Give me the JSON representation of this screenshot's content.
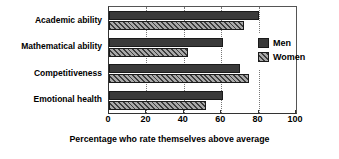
{
  "chart_data": {
    "type": "bar",
    "orientation": "horizontal",
    "title": "",
    "categories": [
      "Academic ability",
      "Mathematical ability",
      "Competitiveness",
      "Emotional health"
    ],
    "series": [
      {
        "name": "Men",
        "values": [
          80,
          61,
          70,
          61
        ],
        "color": "#3a3a3a",
        "fill": "solid"
      },
      {
        "name": "Women",
        "values": [
          72,
          42,
          75,
          52
        ],
        "color": "#a8a8a8",
        "fill": "diagonal-hatch"
      }
    ],
    "xlabel": "Percentage who rate themselves above average",
    "ylabel": "",
    "xlim": [
      0,
      100
    ],
    "xticks": [
      0,
      20,
      40,
      60,
      80,
      100
    ],
    "xtick_labels": [
      "0",
      "20",
      "40",
      "60",
      "80",
      "100"
    ],
    "grid": "vertical-dotted",
    "legend_position": "right-inside",
    "legend_entries": [
      "Men",
      "Women"
    ]
  }
}
